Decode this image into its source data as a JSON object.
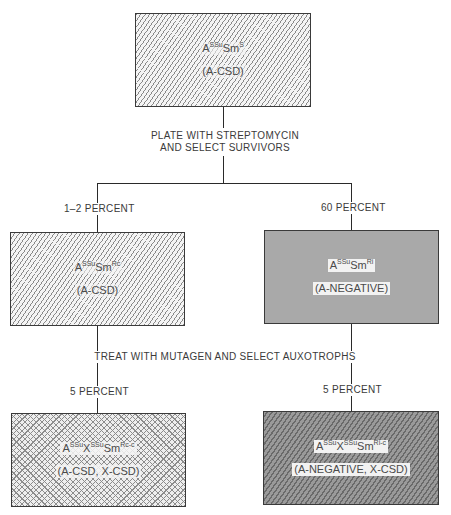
{
  "diagram": {
    "top": {
      "genotype": {
        "base": "A",
        "sup1": "SSu",
        "mid": "Sm",
        "sup2": "S"
      },
      "phenotype": "(A-CSD)",
      "fill": "light-diagonal-hatch"
    },
    "step1": {
      "line1": "PLATE WITH STREPTOMYCIN",
      "line2": "AND SELECT SURVIVORS"
    },
    "branch_left": {
      "percent": "1–2 PERCENT",
      "box": {
        "genotype": {
          "base": "A",
          "sup1": "SSu",
          "mid": "Sm",
          "sup2": "Rc"
        },
        "phenotype": "(A-CSD)",
        "fill": "light-diagonal-hatch"
      }
    },
    "branch_right": {
      "percent": "60 PERCENT",
      "box": {
        "genotype": {
          "base": "A",
          "sup1": "SSu",
          "mid": "Sm",
          "sup2": "Ri"
        },
        "phenotype": "(A-NEGATIVE)",
        "fill": "solid-gray"
      }
    },
    "step2": {
      "label": "TREAT WITH MUTAGEN AND SELECT AUXOTROPHS"
    },
    "bottom_left": {
      "percent": "5 PERCENT",
      "box": {
        "genotype": {
          "base": "A",
          "sup1": "SSu",
          "mid1": "X",
          "sup2": "SSu",
          "mid2": "Sm",
          "sup3": "Rc-c"
        },
        "phenotype": "(A-CSD, X-CSD)",
        "fill": "crosshatch"
      }
    },
    "bottom_right": {
      "percent": "5 PERCENT",
      "box": {
        "genotype": {
          "base": "A",
          "sup1": "SSu",
          "mid1": "X",
          "sup2": "SSu",
          "mid2": "Sm",
          "sup3": "Ri-c"
        },
        "phenotype": "(A-NEGATIVE, X-CSD)",
        "fill": "dark-diagonal-hatch"
      }
    }
  }
}
